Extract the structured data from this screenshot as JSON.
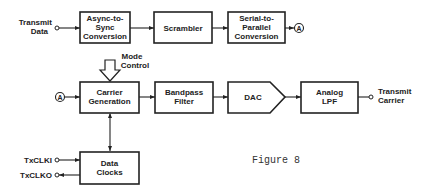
{
  "figure": {
    "caption": "Figure 8"
  },
  "inputs": {
    "transmit_data": [
      "Transmit",
      "Data"
    ],
    "txclki": "TxCLKI",
    "txclko": "TxCLKO",
    "mode_control": [
      "Mode",
      "Control"
    ]
  },
  "outputs": {
    "transmit_carrier": [
      "Transmit",
      "Carrier"
    ]
  },
  "connectors": {
    "a_out": "A",
    "a_in": "A"
  },
  "blocks": {
    "async_to_sync": [
      "Async-to-",
      "Sync",
      "Conversion"
    ],
    "scrambler": [
      "Scrambler"
    ],
    "serial_to_parallel": [
      "Serial-to-",
      "Parallel",
      "Conversion"
    ],
    "carrier_generation": [
      "Carrier",
      "Generation"
    ],
    "bandpass_filter": [
      "Bandpass",
      "Filter"
    ],
    "dac": [
      "DAC"
    ],
    "analog_lpf": [
      "Analog",
      "LPF"
    ],
    "data_clocks": [
      "Data",
      "Clocks"
    ]
  },
  "colors": {
    "ink": "#222222",
    "background": "#ffffff"
  }
}
